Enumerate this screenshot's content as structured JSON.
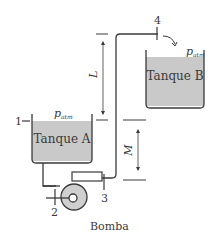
{
  "diagram": {
    "tank_a": {
      "label": "Tanque A",
      "pressure_label": "p",
      "pressure_sub": "atm",
      "point": "1"
    },
    "tank_b": {
      "label": "Tanque B",
      "pressure_label": "p",
      "pressure_sub": "atm"
    },
    "pump": {
      "label": "Bomba"
    },
    "points": {
      "p2": "2",
      "p3": "3",
      "p4": "4"
    },
    "dimensions": {
      "L": "L",
      "M": "M"
    },
    "colors": {
      "fluid": "#c9c9c9",
      "line": "#3a3a3a",
      "pump_fill": "#cfcfcf"
    }
  }
}
